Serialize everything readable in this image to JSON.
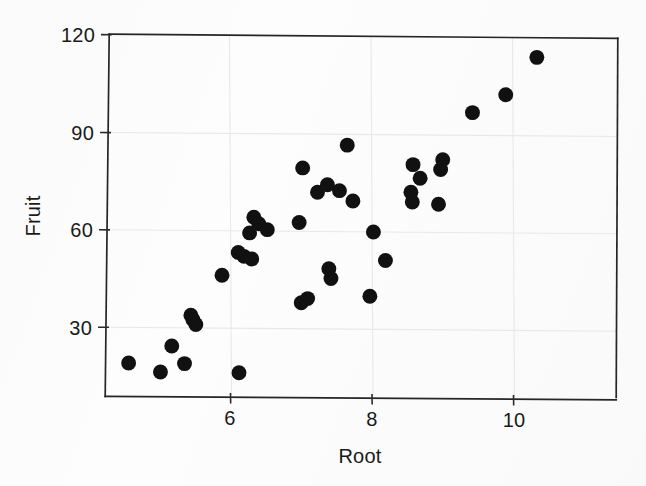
{
  "chart_data": {
    "type": "scatter",
    "title": "",
    "xlabel": "Root",
    "ylabel": "Fruit",
    "xlim": [
      4.35,
      10.65
    ],
    "ylim": [
      12.0,
      120.0
    ],
    "xticks": [
      6,
      8,
      10
    ],
    "xtick_labels": [
      "6",
      "8",
      "10"
    ],
    "yticks": [
      30,
      60,
      90,
      120
    ],
    "ytick_labels": [
      "30",
      "60",
      "90",
      "120"
    ],
    "grid": true,
    "grid_axis": "y",
    "legend": null,
    "marker": "filled-circle",
    "marker_color": "#111111",
    "marker_size": 7.5,
    "n_points": 40,
    "points": [
      {
        "x": 4.56,
        "y": 19.0
      },
      {
        "x": 5.17,
        "y": 24.2
      },
      {
        "x": 5.01,
        "y": 16.2
      },
      {
        "x": 5.35,
        "y": 18.8
      },
      {
        "x": 5.44,
        "y": 33.7
      },
      {
        "x": 5.47,
        "y": 32.3
      },
      {
        "x": 5.51,
        "y": 30.8
      },
      {
        "x": 6.12,
        "y": 16.0
      },
      {
        "x": 5.88,
        "y": 46.0
      },
      {
        "x": 6.11,
        "y": 53.0
      },
      {
        "x": 6.19,
        "y": 51.8
      },
      {
        "x": 6.3,
        "y": 51.0
      },
      {
        "x": 6.27,
        "y": 59.0
      },
      {
        "x": 6.33,
        "y": 63.8
      },
      {
        "x": 6.4,
        "y": 61.8
      },
      {
        "x": 6.52,
        "y": 60.0
      },
      {
        "x": 6.97,
        "y": 62.2
      },
      {
        "x": 7.0,
        "y": 37.5
      },
      {
        "x": 7.09,
        "y": 38.8
      },
      {
        "x": 7.02,
        "y": 79.0
      },
      {
        "x": 7.23,
        "y": 71.5
      },
      {
        "x": 7.37,
        "y": 73.8
      },
      {
        "x": 7.39,
        "y": 48.0
      },
      {
        "x": 7.42,
        "y": 45.0
      },
      {
        "x": 7.65,
        "y": 86.0
      },
      {
        "x": 7.73,
        "y": 68.8
      },
      {
        "x": 7.97,
        "y": 39.5
      },
      {
        "x": 8.02,
        "y": 59.3
      },
      {
        "x": 8.19,
        "y": 50.5
      },
      {
        "x": 8.58,
        "y": 80.0
      },
      {
        "x": 8.55,
        "y": 71.5
      },
      {
        "x": 8.57,
        "y": 68.5
      },
      {
        "x": 8.68,
        "y": 75.8
      },
      {
        "x": 9.0,
        "y": 81.5
      },
      {
        "x": 8.97,
        "y": 78.5
      },
      {
        "x": 8.94,
        "y": 67.8
      },
      {
        "x": 9.42,
        "y": 96.0
      },
      {
        "x": 9.89,
        "y": 101.5
      },
      {
        "x": 10.33,
        "y": 113.0
      },
      {
        "x": 7.54,
        "y": 72.0
      }
    ]
  },
  "figure": {
    "background": "#fdfdfd",
    "frame_color": "#262626",
    "grid_color": "#e8e8e8",
    "text_color": "#1a1a1a"
  }
}
